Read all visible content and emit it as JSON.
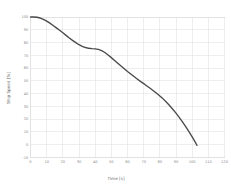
{
  "chart_data": {
    "type": "line",
    "title": "",
    "xlabel": "Time [s]",
    "ylabel": "Ship Speed [%]",
    "xlim": [
      0,
      120
    ],
    "ylim": [
      -10,
      100
    ],
    "grid": true,
    "legend": false,
    "line_color": "#4a4a4a",
    "grid_color": "#e3e3e3",
    "background_color": "#ffffff",
    "xticks": [
      0,
      10,
      20,
      30,
      40,
      50,
      60,
      70,
      80,
      90,
      100,
      110,
      120
    ],
    "xtick_labels": [
      "0",
      "10",
      "20",
      "30",
      "40",
      "50",
      "60",
      "70",
      "80",
      "90",
      "100",
      "110",
      "120"
    ],
    "yticks": [
      -10,
      0,
      10,
      20,
      30,
      40,
      50,
      60,
      70,
      80,
      90,
      100
    ],
    "ytick_labels": [
      "-10",
      "0",
      "10",
      "20",
      "30",
      "40",
      "50",
      "60",
      "70",
      "80",
      "90",
      "100"
    ],
    "series": [
      {
        "name": "Ship Speed",
        "x": [
          0,
          2,
          4,
          6,
          8,
          10,
          12,
          14,
          16,
          18,
          20,
          22,
          24,
          26,
          28,
          30,
          32,
          34,
          36,
          38,
          40,
          42,
          44,
          46,
          48,
          50,
          52,
          54,
          56,
          58,
          60,
          62,
          64,
          66,
          68,
          70,
          72,
          74,
          76,
          78,
          80,
          82,
          84,
          86,
          88,
          90,
          92,
          94,
          96,
          98,
          100,
          102,
          103
        ],
        "y": [
          100,
          100,
          99.8,
          99.2,
          98.2,
          96.8,
          95.2,
          93.4,
          91.5,
          89.6,
          87.6,
          85.6,
          83.6,
          81.7,
          79.9,
          78.3,
          77.0,
          76.1,
          75.5,
          75.2,
          75.0,
          74.6,
          73.7,
          72.2,
          70.3,
          68.2,
          66.0,
          63.8,
          61.6,
          59.5,
          57.4,
          55.4,
          53.4,
          51.5,
          49.6,
          47.8,
          46.0,
          44.2,
          42.3,
          40.3,
          38.2,
          35.9,
          33.4,
          30.7,
          27.8,
          24.7,
          21.4,
          17.9,
          14.2,
          10.3,
          6.2,
          1.8,
          -0.6
        ]
      }
    ]
  }
}
